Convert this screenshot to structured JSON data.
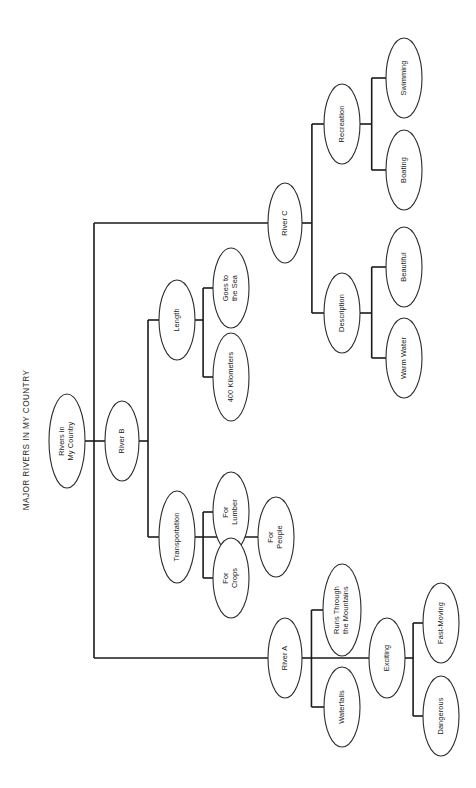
{
  "title": "MAJOR RIVERS IN MY COUNTRY",
  "orientation": "rotated-90-ccw",
  "colors": {
    "background": "#ffffff",
    "edge": "#1a1a1a",
    "node_stroke": "#2b2b2b",
    "node_fill": "#ffffff",
    "text": "#1a1a1a"
  },
  "chart_data": {
    "type": "tree",
    "title": "MAJOR RIVERS IN MY COUNTRY",
    "root": "Rivers in My Country",
    "nodes": [
      {
        "id": "root",
        "label": "Rivers in\nMy Country",
        "level": 0,
        "cx": 67,
        "cy": 441,
        "rx": 18,
        "ry": 47
      },
      {
        "id": "riverC",
        "label": "River C",
        "level": 1,
        "cx": 285,
        "cy": 223,
        "rx": 17,
        "ry": 40
      },
      {
        "id": "riverB",
        "label": "River B",
        "level": 1,
        "cx": 122,
        "cy": 441,
        "rx": 17,
        "ry": 40
      },
      {
        "id": "riverA",
        "label": "River A",
        "level": 1,
        "cx": 285,
        "cy": 658,
        "rx": 17,
        "ry": 40
      },
      {
        "id": "recreation",
        "label": "Recreation",
        "level": 2,
        "cx": 342,
        "cy": 124,
        "rx": 18,
        "ry": 40
      },
      {
        "id": "description",
        "label": "Description",
        "level": 2,
        "cx": 342,
        "cy": 313,
        "rx": 18,
        "ry": 40
      },
      {
        "id": "length",
        "label": "Length",
        "level": 2,
        "cx": 177,
        "cy": 320,
        "rx": 18,
        "ry": 40
      },
      {
        "id": "transport",
        "label": "Transportation",
        "level": 2,
        "cx": 177,
        "cy": 537,
        "rx": 18,
        "ry": 46
      },
      {
        "id": "mountains",
        "label": "Runs Through\nthe Mountains",
        "level": 2,
        "cx": 342,
        "cy": 610,
        "rx": 19,
        "ry": 46
      },
      {
        "id": "waterfalls",
        "label": "Waterfalls",
        "level": 2,
        "cx": 342,
        "cy": 707,
        "rx": 18,
        "ry": 40
      },
      {
        "id": "exciting",
        "label": "Exciting",
        "level": 2,
        "cx": 387,
        "cy": 658,
        "rx": 18,
        "ry": 40
      },
      {
        "id": "swimming",
        "label": "Swimming",
        "level": 3,
        "cx": 404,
        "cy": 78,
        "rx": 18,
        "ry": 40
      },
      {
        "id": "boating",
        "label": "Boating",
        "level": 3,
        "cx": 404,
        "cy": 170,
        "rx": 18,
        "ry": 40
      },
      {
        "id": "warmwater",
        "label": "Warm Water",
        "level": 3,
        "cx": 404,
        "cy": 358,
        "rx": 18,
        "ry": 40
      },
      {
        "id": "beautiful",
        "label": "Beautiful",
        "level": 3,
        "cx": 404,
        "cy": 267,
        "rx": 18,
        "ry": 40
      },
      {
        "id": "goestosea",
        "label": "Goes to\nthe Sea",
        "level": 3,
        "cx": 231,
        "cy": 288,
        "rx": 18,
        "ry": 40
      },
      {
        "id": "kilometers",
        "label": "400 Kilometers",
        "level": 3,
        "cx": 231,
        "cy": 377,
        "rx": 18,
        "ry": 44
      },
      {
        "id": "forlumber",
        "label": "For\nLumber",
        "level": 3,
        "cx": 231,
        "cy": 512,
        "rx": 18,
        "ry": 40
      },
      {
        "id": "forpeople",
        "label": "For\nPeople",
        "level": 3,
        "cx": 276,
        "cy": 537,
        "rx": 18,
        "ry": 40
      },
      {
        "id": "forcrops",
        "label": "For\nCrops",
        "level": 3,
        "cx": 231,
        "cy": 578,
        "rx": 18,
        "ry": 40
      },
      {
        "id": "fastmoving",
        "label": "Fast-Moving",
        "level": 3,
        "cx": 441,
        "cy": 623,
        "rx": 18,
        "ry": 40
      },
      {
        "id": "dangerous",
        "label": "Dangerous",
        "level": 3,
        "cx": 441,
        "cy": 716,
        "rx": 18,
        "ry": 40
      }
    ],
    "edges": [
      {
        "from": "root",
        "to": "riverC"
      },
      {
        "from": "root",
        "to": "riverB"
      },
      {
        "from": "root",
        "to": "riverA"
      },
      {
        "from": "riverC",
        "to": "recreation"
      },
      {
        "from": "riverC",
        "to": "description"
      },
      {
        "from": "riverB",
        "to": "length"
      },
      {
        "from": "riverB",
        "to": "transport"
      },
      {
        "from": "riverA",
        "to": "mountains"
      },
      {
        "from": "riverA",
        "to": "waterfalls"
      },
      {
        "from": "riverA",
        "to": "exciting"
      },
      {
        "from": "recreation",
        "to": "swimming"
      },
      {
        "from": "recreation",
        "to": "boating"
      },
      {
        "from": "description",
        "to": "beautiful"
      },
      {
        "from": "description",
        "to": "warmwater"
      },
      {
        "from": "length",
        "to": "goestosea"
      },
      {
        "from": "length",
        "to": "kilometers"
      },
      {
        "from": "transport",
        "to": "forlumber"
      },
      {
        "from": "transport",
        "to": "forpeople"
      },
      {
        "from": "transport",
        "to": "forcrops"
      },
      {
        "from": "exciting",
        "to": "fastmoving"
      },
      {
        "from": "exciting",
        "to": "dangerous"
      }
    ],
    "hierarchy": {
      "Rivers in My Country": {
        "River A": {
          "Runs Through the Mountains": {},
          "Waterfalls": {},
          "Exciting": {
            "Fast-Moving": {},
            "Dangerous": {}
          }
        },
        "River B": {
          "Transportation": {
            "For Lumber": {},
            "For People": {},
            "For Crops": {}
          },
          "Length": {
            "Goes to the Sea": {},
            "400 Kilometers": {}
          }
        },
        "River C": {
          "Recreation": {
            "Swimming": {},
            "Boating": {}
          },
          "Description": {
            "Warm Water": {},
            "Beautiful": {}
          }
        }
      }
    }
  },
  "title_position": {
    "x": 27,
    "y": 440
  }
}
